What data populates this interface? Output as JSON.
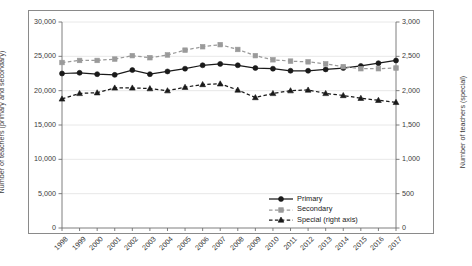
{
  "axes": {
    "left_title": "Number of teachers (primary and secondary)",
    "right_title": "Number of teachers (special)",
    "left_ticks": [
      "0",
      "5,000",
      "10,000",
      "15,000",
      "20,000",
      "25,000",
      "30,000"
    ],
    "right_ticks": [
      "0",
      "500",
      "1,000",
      "1,500",
      "2,000",
      "2,500",
      "3,000"
    ]
  },
  "legend": {
    "items": [
      {
        "label": "Primary",
        "key": "primary"
      },
      {
        "label": "Secondary",
        "key": "secondary"
      },
      {
        "label": "Special (right axis)",
        "key": "special"
      }
    ]
  },
  "colors": {
    "primary": "#1a1a1a",
    "secondary": "#9a9a9a",
    "special": "#1a1a1a",
    "grid": "#e2e2e2",
    "axis": "#6f6f6f",
    "frame": "#8a8a8a",
    "text": "#3a3a3a"
  },
  "chart_data": {
    "type": "line",
    "title": "",
    "xlabel": "",
    "ylabel": "Number of teachers (primary and secondary)",
    "y2label": "Number of teachers (special)",
    "ylim": [
      0,
      30000
    ],
    "y2lim": [
      0,
      3000
    ],
    "ytick_step": 5000,
    "y2tick_step": 500,
    "grid": true,
    "legend_position": "inside-bottom-right",
    "categories": [
      "1998",
      "1999",
      "2000",
      "2001",
      "2002",
      "2003",
      "2004",
      "2005",
      "2006",
      "2007",
      "2008",
      "2009",
      "2010",
      "2011",
      "2012",
      "2013",
      "2014",
      "2015",
      "2016",
      "2017"
    ],
    "series": [
      {
        "name": "Primary",
        "axis": "left",
        "marker": "circle",
        "linestyle": "solid",
        "values": [
          22500,
          22600,
          22400,
          22300,
          23000,
          22400,
          22800,
          23200,
          23700,
          23900,
          23700,
          23300,
          23200,
          22900,
          22900,
          23100,
          23300,
          23600,
          24000,
          24400
        ]
      },
      {
        "name": "Secondary",
        "axis": "left",
        "marker": "square",
        "linestyle": "dashed",
        "values": [
          24100,
          24400,
          24400,
          24600,
          25100,
          24800,
          25200,
          25900,
          26400,
          26700,
          26000,
          25100,
          24500,
          24300,
          24200,
          23900,
          23500,
          23200,
          23200,
          23300
        ]
      },
      {
        "name": "Special (right axis)",
        "axis": "right",
        "marker": "triangle",
        "linestyle": "dashed",
        "values": [
          1880,
          1960,
          1970,
          2040,
          2040,
          2030,
          2000,
          2050,
          2090,
          2100,
          2010,
          1900,
          1960,
          2000,
          2010,
          1960,
          1930,
          1890,
          1860,
          1830
        ]
      }
    ]
  }
}
